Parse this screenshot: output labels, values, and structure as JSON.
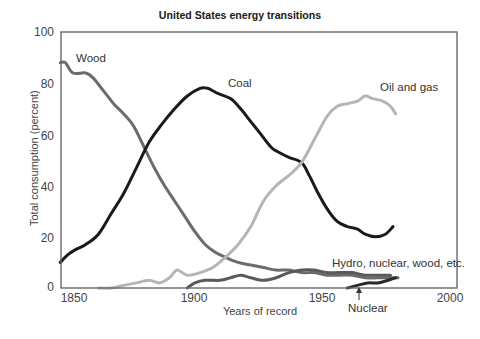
{
  "chart_data": {
    "type": "line",
    "title": "United States energy transitions",
    "xlabel": "Years of record",
    "ylabel": "Total consumption (percent)",
    "xlim": [
      1845,
      2003
    ],
    "ylim": [
      0,
      100
    ],
    "xticks": [
      1850,
      1900,
      1950,
      2000
    ],
    "yticks": [
      0,
      20,
      40,
      60,
      80,
      100
    ],
    "grid": false,
    "legend": "inline labels",
    "series": [
      {
        "name": "Wood",
        "color": "#6b6b6b",
        "x": [
          1845,
          1847,
          1850,
          1855,
          1858,
          1862,
          1866,
          1870,
          1874,
          1878,
          1882,
          1886,
          1890,
          1894,
          1898,
          1902,
          1906,
          1910,
          1915,
          1920,
          1925,
          1930,
          1935,
          1940,
          1945,
          1950,
          1955,
          1960,
          1965,
          1970,
          1975,
          1978
        ],
        "y": [
          88,
          88,
          84,
          84,
          82,
          77,
          72,
          68,
          63,
          55,
          47,
          40,
          34,
          28,
          22,
          17,
          14,
          12,
          10,
          9,
          8,
          7,
          7,
          6,
          6,
          5,
          5,
          5,
          4,
          4,
          4,
          4
        ]
      },
      {
        "name": "Coal",
        "color": "#1a1a1a",
        "x": [
          1845,
          1848,
          1851,
          1855,
          1860,
          1865,
          1870,
          1875,
          1880,
          1885,
          1890,
          1895,
          1900,
          1903,
          1907,
          1912,
          1916,
          1920,
          1924,
          1928,
          1931,
          1935,
          1940,
          1943,
          1946,
          1950,
          1954,
          1958,
          1962,
          1965,
          1969,
          1973,
          1976
        ],
        "y": [
          10,
          13,
          15,
          17,
          21,
          29,
          37,
          47,
          57,
          64,
          70,
          75,
          78,
          78,
          76,
          74,
          70,
          65,
          60,
          55,
          53,
          51,
          49,
          44,
          38,
          31,
          26,
          24,
          23,
          21,
          20,
          21,
          24
        ]
      },
      {
        "name": "Oil and gas",
        "color": "#b5b5b5",
        "x": [
          1860,
          1865,
          1870,
          1875,
          1880,
          1884,
          1888,
          1891,
          1895,
          1900,
          1905,
          1910,
          1915,
          1920,
          1925,
          1930,
          1935,
          1940,
          1945,
          1950,
          1954,
          1958,
          1962,
          1965,
          1968,
          1972,
          1975,
          1977
        ],
        "y": [
          0,
          0,
          1,
          2,
          3,
          2,
          4,
          7,
          5,
          6,
          8,
          12,
          17,
          24,
          34,
          40,
          44,
          49,
          58,
          67,
          71,
          72,
          73,
          75,
          74,
          73,
          71,
          68
        ]
      },
      {
        "name": "Hydro, nuclear, wood, etc.",
        "color": "#5a5a5a",
        "x": [
          1895,
          1898,
          1902,
          1908,
          1912,
          1916,
          1920,
          1925,
          1930,
          1935,
          1940,
          1945,
          1950,
          1955,
          1960,
          1965,
          1970,
          1975
        ],
        "y": [
          0,
          2,
          3,
          3,
          4,
          5,
          4,
          3,
          4,
          6,
          7,
          7,
          6,
          6,
          6,
          5,
          5,
          5
        ]
      },
      {
        "name": "Nuclear",
        "color": "#2a2a2a",
        "x": [
          1958,
          1962,
          1966,
          1970,
          1974,
          1977
        ],
        "y": [
          0,
          1,
          2,
          2,
          3,
          4
        ]
      }
    ],
    "annotations": [
      {
        "text": "Wood",
        "x": 1857,
        "y": 89
      },
      {
        "text": "Coal",
        "x": 1912,
        "y": 78
      },
      {
        "text": "Oil and gas",
        "x": 1970,
        "y": 77
      },
      {
        "text": "Hydro, nuclear, wood, etc.",
        "x": 1968,
        "y": 10
      },
      {
        "text": "Nuclear",
        "x": 1958,
        "y": -9,
        "arrow_to": [
          1958,
          0
        ]
      }
    ]
  },
  "labels": {
    "title": "United States energy transitions",
    "xlabel": "Years of record",
    "ylabel": "Total consumption (percent)",
    "wood": "Wood",
    "coal": "Coal",
    "oil": "Oil and gas",
    "hydro": "Hydro, nuclear, wood, etc.",
    "nuclear": "Nuclear",
    "yticks": [
      "100",
      "80",
      "60",
      "40",
      "20",
      "0"
    ],
    "xticks": [
      "1850",
      "1900",
      "1950",
      "2000"
    ]
  }
}
